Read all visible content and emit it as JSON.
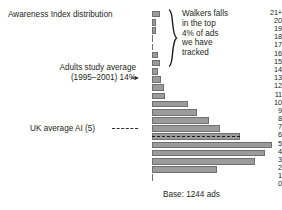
{
  "annotations": {
    "title": "Awareness Index distribution",
    "adults_line1": "Adults study average",
    "adults_line2": "(1995–2001) 14%",
    "uk_average": "UK average AI (5)",
    "base": "Base: 1244 ads",
    "callout": [
      "Walkers falls",
      "in the top",
      "4% of ads",
      "we have",
      "tracked"
    ]
  },
  "colors": {
    "bar_fill": "#9b9b9b",
    "bar_stroke": "#6f6f6f",
    "text": "#231f20",
    "background": "#ffffff"
  },
  "chart_data": {
    "type": "bar",
    "orientation": "horizontal",
    "title": "Awareness Index distribution",
    "xlabel": "",
    "ylabel": "Awareness Index",
    "grid": false,
    "legend": null,
    "base_note": "Base: 1244 ads",
    "categories": [
      "21+",
      "20",
      "19",
      "18",
      "17",
      "16",
      "15",
      "14",
      "13",
      "12",
      "11",
      "10",
      "9",
      "8",
      "7",
      "6",
      "5",
      "4",
      "3",
      "2",
      "1",
      "0"
    ],
    "values": [
      8,
      4,
      4,
      1,
      1,
      6,
      8,
      6,
      9,
      12,
      13,
      36,
      45,
      57,
      68,
      88,
      120,
      113,
      103,
      65,
      1,
      0
    ],
    "value_units": "pixel-length (relative frequency of ads)",
    "xlim": [
      0,
      120
    ],
    "markers": [
      {
        "label": "Adults study average (1995–2001) 14%",
        "category": "14",
        "type": "arrow"
      },
      {
        "label": "UK average AI (5)",
        "category": "6",
        "type": "dashed-line"
      }
    ],
    "callout": "Walkers falls in the top 4% of ads we have tracked"
  }
}
